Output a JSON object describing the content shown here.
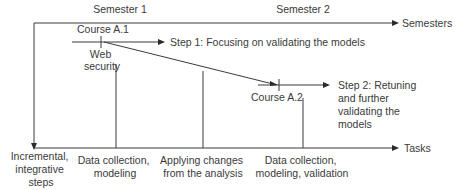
{
  "axes": {
    "semesters_label": "Semesters",
    "tasks_label": "Tasks",
    "incremental_label": [
      "Incremental,",
      "integrative",
      "steps"
    ]
  },
  "semesters": [
    "Semester 1",
    "Semester 2"
  ],
  "courses": {
    "a1": {
      "name": "Course A.1",
      "topic": [
        "Web",
        "security"
      ]
    },
    "a2": {
      "name": "Course A.2"
    }
  },
  "steps": {
    "step1": "Step 1: Focusing on validating the models",
    "step2": [
      "Step 2: Retuning",
      "and further",
      "validating the",
      "models"
    ]
  },
  "tasks": {
    "t1": [
      "Data collection,",
      "modeling"
    ],
    "t2": [
      "Applying changes",
      "from the analysis"
    ],
    "t3": [
      "Data collection,",
      "modeling, validation"
    ]
  }
}
